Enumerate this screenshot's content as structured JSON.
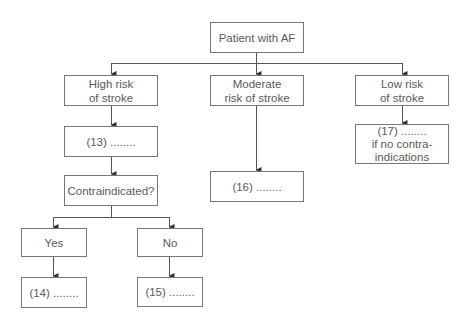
{
  "diagram": {
    "type": "flowchart",
    "colors": {
      "line": "#555555",
      "border": "#777777",
      "text": "#5a5a5a",
      "background": "#ffffff"
    },
    "nodes": {
      "root": "Patient with AF",
      "high_risk": {
        "line1": "High risk",
        "line2": "of stroke"
      },
      "moderate_risk": {
        "line1": "Moderate",
        "line2": "risk of stroke"
      },
      "low_risk": {
        "line1": "Low risk",
        "line2": "of stroke"
      },
      "n13": "(13) ........",
      "contraindicated": "Contraindicated?",
      "yes": "Yes",
      "no": "No",
      "n14": "(14) ........",
      "n15": "(15) ........",
      "n16": "(16) ........",
      "n17": {
        "line1": "(17) ........",
        "line2": "if no contra-",
        "line3": "indications"
      }
    },
    "edges": [
      [
        "root",
        "high_risk"
      ],
      [
        "root",
        "moderate_risk"
      ],
      [
        "root",
        "low_risk"
      ],
      [
        "high_risk",
        "n13"
      ],
      [
        "n13",
        "contraindicated"
      ],
      [
        "contraindicated",
        "yes"
      ],
      [
        "contraindicated",
        "no"
      ],
      [
        "yes",
        "n14"
      ],
      [
        "no",
        "n15"
      ],
      [
        "moderate_risk",
        "n16"
      ],
      [
        "low_risk",
        "n17"
      ]
    ]
  }
}
